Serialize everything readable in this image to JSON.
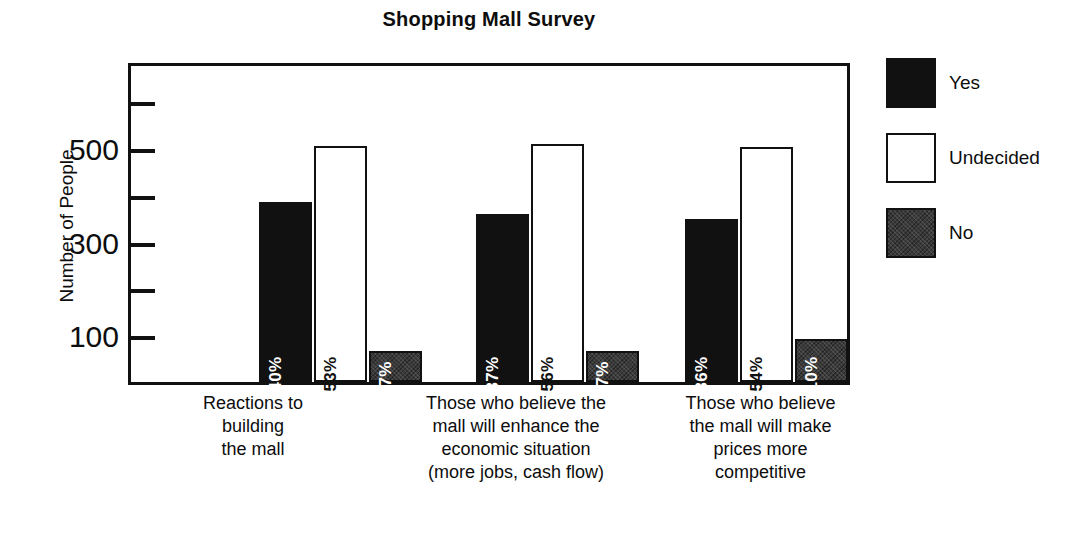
{
  "chart_data": {
    "type": "bar",
    "title": "Shopping Mall Survey",
    "xlabel": "",
    "ylabel": "Number of People",
    "ylim": [
      0,
      650
    ],
    "grid": false,
    "legend_position": "right",
    "y_ticks": [
      100,
      200,
      300,
      400,
      500,
      600
    ],
    "y_tick_labels": [
      "100",
      "",
      "300",
      "",
      "500",
      ""
    ],
    "categories": [
      "Reactions to building the mall",
      "Those who believe the mall will enhance the economic situation (more jobs, cash flow)",
      "Those who believe the mall will make prices more competitive"
    ],
    "category_lines": [
      [
        "Reactions to",
        "building",
        "the mall"
      ],
      [
        "Those who believe the",
        "mall will enhance the",
        "economic situation",
        "(more jobs, cash flow)"
      ],
      [
        "Those who believe",
        "the mall will make",
        "prices more",
        "competitive"
      ]
    ],
    "series": [
      {
        "name": "Yes",
        "color": "#111111",
        "values": [
          385,
          360,
          348
        ],
        "labels": [
          "40%",
          "37%",
          "36%"
        ]
      },
      {
        "name": "Undecided",
        "color": "#ffffff",
        "values": [
          505,
          508,
          502
        ],
        "labels": [
          "53%",
          "56%",
          "54%"
        ]
      },
      {
        "name": "No",
        "color": "#3a3a3a",
        "values": [
          67,
          67,
          92
        ],
        "labels": [
          "7%",
          "7%",
          "10%"
        ]
      }
    ],
    "legend": [
      {
        "label": "Yes",
        "swatch": "solid-black"
      },
      {
        "label": "Undecided",
        "swatch": "white-outline"
      },
      {
        "label": "No",
        "swatch": "dark-textured"
      }
    ]
  }
}
